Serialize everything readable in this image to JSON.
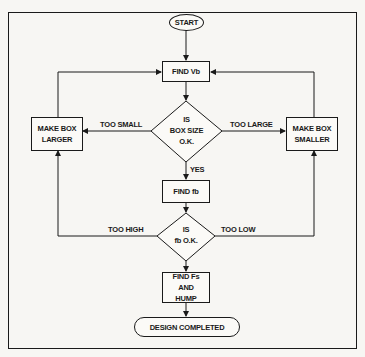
{
  "diagram": {
    "type": "flowchart",
    "nodes": {
      "start": {
        "label": "START",
        "shape": "oval"
      },
      "find_vb": {
        "label": "FIND Vb",
        "shape": "process"
      },
      "decision_box_size": {
        "lines": [
          "IS",
          "BOX SIZE",
          "O.K."
        ],
        "shape": "decision"
      },
      "make_box_larger": {
        "lines": [
          "MAKE BOX",
          "LARGER"
        ],
        "shape": "process"
      },
      "make_box_smaller": {
        "lines": [
          "MAKE BOX",
          "SMALLER"
        ],
        "shape": "process"
      },
      "find_fb": {
        "label": "FIND fb",
        "shape": "process"
      },
      "decision_fb": {
        "lines": [
          "IS",
          "fb O.K."
        ],
        "shape": "decision"
      },
      "find_fs_hump": {
        "lines": [
          "FIND Fs",
          "AND",
          "HUMP"
        ],
        "shape": "process"
      },
      "design_completed": {
        "label": "DESIGN COMPLETED",
        "shape": "terminator"
      }
    },
    "edges": {
      "too_small": "TOO SMALL",
      "too_large": "TOO LARGE",
      "yes": "YES",
      "too_high": "TOO HIGH",
      "too_low": "TOO LOW"
    },
    "colors": {
      "ink": "#1a1a1a",
      "paper": "#f7f6f3"
    }
  }
}
